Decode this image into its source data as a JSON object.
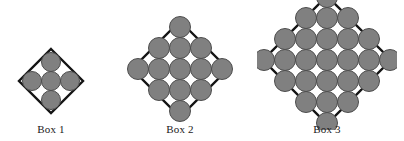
{
  "figure": {
    "title": "",
    "background_color": "#ffffff",
    "diamond_stroke_color": "#141414",
    "diamond_fill_color": "#ffffff",
    "circle_fill_color": "#808080",
    "circle_stroke_color": "#4d4d4d",
    "label_color": "#1a1a1a"
  },
  "chart_data": {
    "type": "diagram",
    "categories": [
      "Box 1",
      "Box 2",
      "Box 3"
    ],
    "values": [
      5,
      13,
      25
    ],
    "ylabel": "Number of circles",
    "xlabel": "Box",
    "grid": false,
    "legend": "none",
    "annotations": [
      "Box 1 rows: 1, 3, 1",
      "Box 2 rows: 1, 3, 5, 3, 1",
      "Box 3 rows: 1, 3, 5, 7, 5, 3, 1"
    ]
  },
  "boxes": [
    {
      "label": "Box 1",
      "circle_count": 5,
      "grid_n": 2,
      "rows": [
        1,
        3,
        1
      ],
      "cx": 51,
      "cy": 81,
      "half_diagonal": 32,
      "circle_radius": 9.5,
      "spacing": 19,
      "label_x": 51,
      "label_y": 123
    },
    {
      "label": "Box 2",
      "circle_count": 13,
      "grid_n": 3,
      "rows": [
        1,
        3,
        5,
        3,
        1
      ],
      "cx": 180,
      "cy": 69,
      "half_diagonal": 48,
      "circle_radius": 10.5,
      "spacing": 21,
      "label_x": 180,
      "label_y": 123
    },
    {
      "label": "Box 3",
      "circle_count": 25,
      "grid_n": 4,
      "rows": [
        1,
        3,
        5,
        7,
        5,
        3,
        1
      ],
      "cx": 327,
      "cy": 60,
      "half_diagonal": 64,
      "circle_radius": 10.5,
      "spacing": 21,
      "label_x": 327,
      "label_y": 123
    }
  ]
}
